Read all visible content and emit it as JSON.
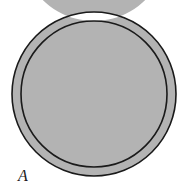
{
  "figure": {
    "type": "line-diagram",
    "background_color": "#ffffff",
    "label": "A",
    "label_style": "italic",
    "shape": {
      "name": "annulus",
      "description": "circular ring with gray band and dark outlines",
      "center_x": 94,
      "center_y": 94,
      "outer_radius": 82,
      "inner_radius": 73,
      "band_width": 9,
      "band_fill_color": "#b3b3b3",
      "outline_color": "#1a1a1a",
      "outline_width": 1.6,
      "interior_fill_color": "#ffffff"
    }
  }
}
